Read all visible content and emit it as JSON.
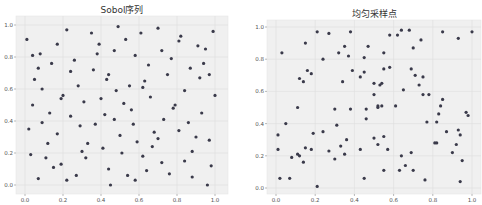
{
  "chart_data": [
    {
      "type": "scatter",
      "title": "Sobol序列",
      "xlabel": "",
      "ylabel": "",
      "xlim": [
        -0.02,
        1.02
      ],
      "ylim": [
        -0.03,
        1.03
      ],
      "grid": true,
      "xticks": [
        "0.0",
        "0.2",
        "0.4",
        "0.6",
        "0.8",
        "1.0"
      ],
      "yticks": [
        "0.0",
        "0.2",
        "0.4",
        "0.6",
        "0.8",
        "1.0"
      ],
      "color": "#3a3a4a",
      "points": [
        [
          0.01,
          0.91
        ],
        [
          0.02,
          0.35
        ],
        [
          0.03,
          0.19
        ],
        [
          0.04,
          0.81
        ],
        [
          0.04,
          0.5
        ],
        [
          0.05,
          0.66
        ],
        [
          0.07,
          0.73
        ],
        [
          0.07,
          0.04
        ],
        [
          0.08,
          0.82
        ],
        [
          0.09,
          0.39
        ],
        [
          0.09,
          0.6
        ],
        [
          0.11,
          0.17
        ],
        [
          0.12,
          0.26
        ],
        [
          0.13,
          0.45
        ],
        [
          0.14,
          0.76
        ],
        [
          0.15,
          0.11
        ],
        [
          0.17,
          0.32
        ],
        [
          0.17,
          0.88
        ],
        [
          0.19,
          0.54
        ],
        [
          0.19,
          0.13
        ],
        [
          0.2,
          0.56
        ],
        [
          0.22,
          0.97
        ],
        [
          0.22,
          0.03
        ],
        [
          0.24,
          0.71
        ],
        [
          0.24,
          0.43
        ],
        [
          0.26,
          0.78
        ],
        [
          0.27,
          0.06
        ],
        [
          0.28,
          0.62
        ],
        [
          0.29,
          0.37
        ],
        [
          0.3,
          0.21
        ],
        [
          0.31,
          0.52
        ],
        [
          0.32,
          0.17
        ],
        [
          0.33,
          0.26
        ],
        [
          0.35,
          0.95
        ],
        [
          0.36,
          0.72
        ],
        [
          0.37,
          0.38
        ],
        [
          0.38,
          0.82
        ],
        [
          0.39,
          0.88
        ],
        [
          0.4,
          0.54
        ],
        [
          0.41,
          0.23
        ],
        [
          0.42,
          0.44
        ],
        [
          0.43,
          0.66
        ],
        [
          0.44,
          0.1
        ],
        [
          0.44,
          0.69
        ],
        [
          0.45,
          0.0
        ],
        [
          0.47,
          0.84
        ],
        [
          0.47,
          0.41
        ],
        [
          0.48,
          0.59
        ],
        [
          0.49,
          0.99
        ],
        [
          0.5,
          0.31
        ],
        [
          0.51,
          0.2
        ],
        [
          0.52,
          0.51
        ],
        [
          0.53,
          0.91
        ],
        [
          0.54,
          0.06
        ],
        [
          0.55,
          0.62
        ],
        [
          0.56,
          0.47
        ],
        [
          0.57,
          0.38
        ],
        [
          0.58,
          0.81
        ],
        [
          0.58,
          0.03
        ],
        [
          0.59,
          0.27
        ],
        [
          0.61,
          0.95
        ],
        [
          0.62,
          0.18
        ],
        [
          0.62,
          0.61
        ],
        [
          0.63,
          0.65
        ],
        [
          0.64,
          0.09
        ],
        [
          0.65,
          0.75
        ],
        [
          0.66,
          0.55
        ],
        [
          0.67,
          0.24
        ],
        [
          0.68,
          0.33
        ],
        [
          0.7,
          0.98
        ],
        [
          0.7,
          0.29
        ],
        [
          0.72,
          0.14
        ],
        [
          0.72,
          0.84
        ],
        [
          0.73,
          0.41
        ],
        [
          0.75,
          0.69
        ],
        [
          0.76,
          0.07
        ],
        [
          0.77,
          0.79
        ],
        [
          0.78,
          0.48
        ],
        [
          0.79,
          0.5
        ],
        [
          0.81,
          0.9
        ],
        [
          0.81,
          0.34
        ],
        [
          0.82,
          0.93
        ],
        [
          0.84,
          0.59
        ],
        [
          0.84,
          0.15
        ],
        [
          0.86,
          0.39
        ],
        [
          0.87,
          0.73
        ],
        [
          0.88,
          0.05
        ],
        [
          0.88,
          0.21
        ],
        [
          0.9,
          0.3
        ],
        [
          0.91,
          0.87
        ],
        [
          0.92,
          0.67
        ],
        [
          0.93,
          0.45
        ],
        [
          0.94,
          0.76
        ],
        [
          0.95,
          0.85
        ],
        [
          0.96,
          0.0
        ],
        [
          0.97,
          0.69
        ],
        [
          0.97,
          0.28
        ],
        [
          0.98,
          0.12
        ],
        [
          0.99,
          0.96
        ],
        [
          1.0,
          0.56
        ]
      ]
    },
    {
      "type": "scatter",
      "title": "均匀采样点",
      "xlabel": "",
      "ylabel": "",
      "xlim": [
        -0.02,
        1.02
      ],
      "ylim": [
        -0.03,
        1.03
      ],
      "grid": true,
      "xticks": [
        "0.0",
        "0.2",
        "0.4",
        "0.6",
        "0.8",
        "1.0"
      ],
      "yticks": [
        "0.0",
        "0.2",
        "0.4",
        "0.6",
        "0.8",
        "1.0"
      ],
      "color": "#3a3a4a",
      "points": [
        [
          0.01,
          0.24
        ],
        [
          0.01,
          0.33
        ],
        [
          0.02,
          0.06
        ],
        [
          0.03,
          0.84
        ],
        [
          0.05,
          0.4
        ],
        [
          0.07,
          0.06
        ],
        [
          0.08,
          0.19
        ],
        [
          0.11,
          0.21
        ],
        [
          0.11,
          0.5
        ],
        [
          0.12,
          0.2
        ],
        [
          0.12,
          0.68
        ],
        [
          0.14,
          0.16
        ],
        [
          0.14,
          0.66
        ],
        [
          0.15,
          0.25
        ],
        [
          0.15,
          0.9
        ],
        [
          0.16,
          0.73
        ],
        [
          0.18,
          0.24
        ],
        [
          0.18,
          0.71
        ],
        [
          0.19,
          0.34
        ],
        [
          0.21,
          0.01
        ],
        [
          0.21,
          0.97
        ],
        [
          0.24,
          0.8
        ],
        [
          0.24,
          0.35
        ],
        [
          0.27,
          0.23
        ],
        [
          0.27,
          0.96
        ],
        [
          0.3,
          0.18
        ],
        [
          0.3,
          0.49
        ],
        [
          0.31,
          0.39
        ],
        [
          0.32,
          0.84
        ],
        [
          0.33,
          0.26
        ],
        [
          0.34,
          0.66
        ],
        [
          0.35,
          0.21
        ],
        [
          0.35,
          0.88
        ],
        [
          0.36,
          0.3
        ],
        [
          0.37,
          0.82
        ],
        [
          0.38,
          0.49
        ],
        [
          0.38,
          0.97
        ],
        [
          0.39,
          0.73
        ],
        [
          0.43,
          0.24
        ],
        [
          0.43,
          0.69
        ],
        [
          0.45,
          0.06
        ],
        [
          0.45,
          0.72
        ],
        [
          0.45,
          0.81
        ],
        [
          0.46,
          0.49
        ],
        [
          0.46,
          0.43
        ],
        [
          0.47,
          0.88
        ],
        [
          0.5,
          0.31
        ],
        [
          0.5,
          0.65
        ],
        [
          0.5,
          0.58
        ],
        [
          0.52,
          0.27
        ],
        [
          0.52,
          0.51
        ],
        [
          0.53,
          0.64
        ],
        [
          0.54,
          0.65
        ],
        [
          0.54,
          0.51
        ],
        [
          0.55,
          0.74
        ],
        [
          0.55,
          0.84
        ],
        [
          0.55,
          0.32
        ],
        [
          0.55,
          0.11
        ],
        [
          0.57,
          0.24
        ],
        [
          0.58,
          0.75
        ],
        [
          0.58,
          0.95
        ],
        [
          0.61,
          0.51
        ],
        [
          0.62,
          0.95
        ],
        [
          0.63,
          0.11
        ],
        [
          0.64,
          0.98
        ],
        [
          0.64,
          0.2
        ],
        [
          0.65,
          0.61
        ],
        [
          0.66,
          0.14
        ],
        [
          0.68,
          0.98
        ],
        [
          0.69,
          0.22
        ],
        [
          0.69,
          0.74
        ],
        [
          0.7,
          0.87
        ],
        [
          0.7,
          0.11
        ],
        [
          0.71,
          0.7
        ],
        [
          0.73,
          0.64
        ],
        [
          0.74,
          0.92
        ],
        [
          0.75,
          0.58
        ],
        [
          0.75,
          0.69
        ],
        [
          0.76,
          0.05
        ],
        [
          0.77,
          0.41
        ],
        [
          0.78,
          0.58
        ],
        [
          0.81,
          0.28
        ],
        [
          0.82,
          0.41
        ],
        [
          0.82,
          0.28
        ],
        [
          0.83,
          0.46
        ],
        [
          0.84,
          0.51
        ],
        [
          0.85,
          0.55
        ],
        [
          0.85,
          0.97
        ],
        [
          0.87,
          0.35
        ],
        [
          0.9,
          0.22
        ],
        [
          0.92,
          0.27
        ],
        [
          0.93,
          0.36
        ],
        [
          0.93,
          0.93
        ],
        [
          0.94,
          0.33
        ],
        [
          0.94,
          0.04
        ],
        [
          0.95,
          0.17
        ],
        [
          0.97,
          0.47
        ],
        [
          0.98,
          0.45
        ],
        [
          1.0,
          0.97
        ],
        [
          0.52,
          0.5
        ]
      ]
    }
  ]
}
